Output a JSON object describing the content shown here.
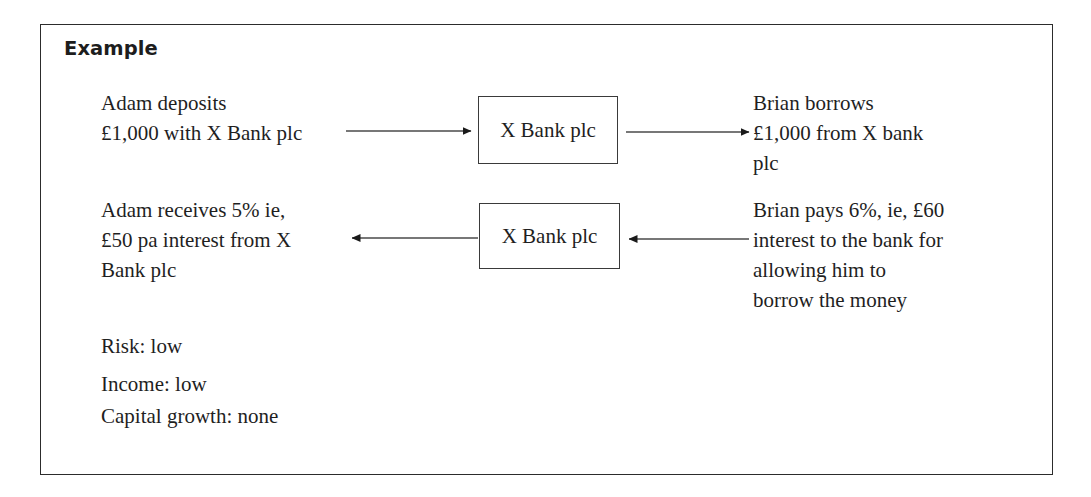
{
  "panel": {
    "heading": "Example",
    "border_color": "#2c2c2c",
    "background": "#ffffff",
    "text_color": "#1f1f1f"
  },
  "flow": {
    "top_row": {
      "left_text": {
        "lines": [
          "Adam deposits",
          "£1,000 with X Bank plc"
        ]
      },
      "node": {
        "label": "X Bank plc"
      },
      "right_text": {
        "lines": [
          "Brian borrows",
          "£1,000 from X bank",
          "plc"
        ]
      },
      "arrow_in_direction": "right",
      "arrow_out_direction": "right"
    },
    "bottom_row": {
      "left_text": {
        "lines": [
          "Adam receives 5% ie,",
          "£50 pa interest from X",
          "Bank plc"
        ]
      },
      "node": {
        "label": "X Bank plc"
      },
      "right_text": {
        "lines": [
          "Brian pays 6%, ie, £60",
          "interest to the bank for",
          "allowing him to",
          "borrow the money"
        ]
      },
      "arrow_in_direction": "left",
      "arrow_out_direction": "left"
    }
  },
  "summary": {
    "items": [
      {
        "label": "Risk: low"
      },
      {
        "label": "Income: low"
      },
      {
        "label": "Capital growth: none"
      }
    ]
  }
}
